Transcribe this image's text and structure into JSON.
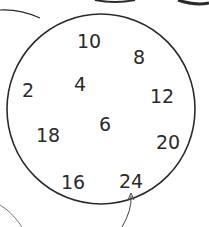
{
  "diagram": {
    "shape": "circle",
    "stroke_color": "#2a2a2a",
    "numbers": [
      {
        "label": "10",
        "x": 89,
        "y": 41
      },
      {
        "label": "8",
        "x": 139,
        "y": 57
      },
      {
        "label": "2",
        "x": 28,
        "y": 90
      },
      {
        "label": "4",
        "x": 80,
        "y": 84
      },
      {
        "label": "12",
        "x": 162,
        "y": 96
      },
      {
        "label": "6",
        "x": 105,
        "y": 124
      },
      {
        "label": "18",
        "x": 48,
        "y": 135
      },
      {
        "label": "20",
        "x": 168,
        "y": 142
      },
      {
        "label": "16",
        "x": 73,
        "y": 182
      },
      {
        "label": "24",
        "x": 131,
        "y": 181
      }
    ],
    "arrow": {
      "points_to": "24"
    }
  }
}
